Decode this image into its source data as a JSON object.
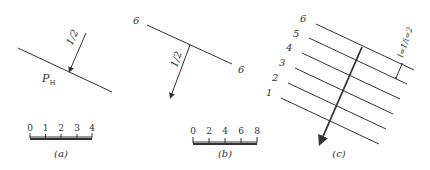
{
  "panels": [
    {
      "id": "a",
      "caption": "(a)",
      "plane_label": "P",
      "plane_subscript": "H",
      "slope_label": "1/2",
      "scale": {
        "ticks": [
          "0",
          "1",
          "2",
          "3",
          "4"
        ]
      }
    },
    {
      "id": "b",
      "caption": "(b)",
      "contour_label_left": "6",
      "contour_label_right": "6",
      "slope_label": "1/2",
      "scale": {
        "ticks": [
          "0",
          "2",
          "4",
          "6",
          "8"
        ]
      }
    },
    {
      "id": "c",
      "caption": "(c)",
      "contour_labels": [
        "1",
        "2",
        "3",
        "4",
        "5",
        "6"
      ],
      "interval_label": "l=1/i=2"
    }
  ]
}
